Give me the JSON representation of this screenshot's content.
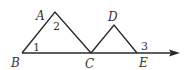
{
  "diagram": {
    "type": "geometry-figure",
    "stroke_color": "#2a2a2a",
    "points": {
      "A": {
        "label": "A",
        "x": 55,
        "y": 12
      },
      "B": {
        "label": "B",
        "x": 22,
        "y": 53
      },
      "C": {
        "label": "C",
        "x": 91,
        "y": 53
      },
      "D": {
        "label": "D",
        "x": 114,
        "y": 25
      },
      "E": {
        "label": "E",
        "x": 137,
        "y": 53
      }
    },
    "ray": {
      "from": "B",
      "through": "E",
      "arrow_tip_x": 178
    },
    "segments": [
      "AB",
      "AC",
      "CD",
      "DE",
      "BE"
    ],
    "angles": {
      "angle1": {
        "label": "1",
        "vertex": "B"
      },
      "angle2": {
        "label": "2",
        "vertex": "A"
      },
      "angle3": {
        "label": "3",
        "vertex": "E",
        "position": "exterior, above ray"
      }
    }
  }
}
